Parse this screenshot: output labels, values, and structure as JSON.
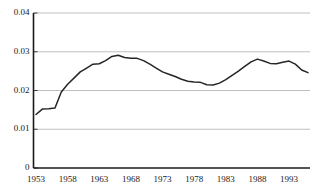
{
  "chart_data": {
    "type": "line",
    "title": "",
    "subtitle": "",
    "xlabel": "",
    "ylabel": "",
    "xlim": [
      1953,
      1996
    ],
    "ylim": [
      0,
      0.04
    ],
    "grid": true,
    "grid_axis": "y",
    "legend": false,
    "legend_position": "none",
    "line_color": "#262626",
    "grid_color": "#b0b0b0",
    "axis_color": "#1a1a1a",
    "background": "#ffffff",
    "xticks": [
      1953,
      1958,
      1963,
      1968,
      1973,
      1978,
      1983,
      1988,
      1993
    ],
    "xtick_labels": [
      "1953",
      "1958",
      "1963",
      "1968",
      "1973",
      "1978",
      "1983",
      "1988",
      "1993"
    ],
    "yticks": [
      0,
      0.01,
      0.02,
      0.03,
      0.04
    ],
    "ytick_labels": [
      "0",
      "0.01",
      "0.02",
      "0.03",
      "0.04"
    ],
    "series": [
      {
        "name": "series-1",
        "x": [
          1953,
          1954,
          1955,
          1956,
          1957,
          1958,
          1959,
          1960,
          1961,
          1962,
          1963,
          1964,
          1965,
          1966,
          1967,
          1968,
          1969,
          1970,
          1971,
          1972,
          1973,
          1974,
          1975,
          1976,
          1977,
          1978,
          1979,
          1980,
          1981,
          1982,
          1983,
          1984,
          1985,
          1986,
          1987,
          1988,
          1989,
          1990,
          1991,
          1992,
          1993,
          1994,
          1995,
          1996
        ],
        "values": [
          0.0138,
          0.0152,
          0.0153,
          0.0155,
          0.0196,
          0.0216,
          0.0232,
          0.0248,
          0.0258,
          0.0268,
          0.0269,
          0.0277,
          0.0288,
          0.0291,
          0.0285,
          0.0283,
          0.0283,
          0.0277,
          0.0268,
          0.0258,
          0.0248,
          0.0242,
          0.0236,
          0.0229,
          0.0224,
          0.0222,
          0.0221,
          0.0215,
          0.0214,
          0.0219,
          0.0228,
          0.0239,
          0.025,
          0.0262,
          0.0274,
          0.0281,
          0.0276,
          0.027,
          0.0269,
          0.0273,
          0.0276,
          0.0268,
          0.0253,
          0.0246
        ]
      }
    ]
  }
}
